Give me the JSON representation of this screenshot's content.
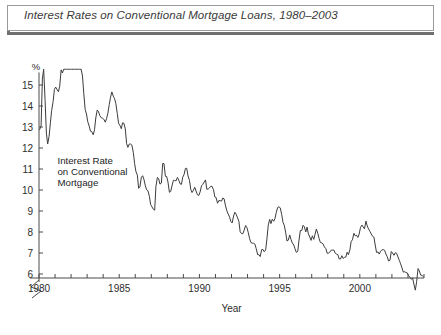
{
  "figure": {
    "title": "Interest Rates on Conventional Mortgage Loans, 1980–2003",
    "annotation_line1": "Interest Rate",
    "annotation_line2": "on Conventional",
    "annotation_line3": "Mortgage",
    "unit_label": "%",
    "xaxis_title": "Year",
    "frame_color": "#9a9a9a",
    "rule_color": "#6f6f6f",
    "line_color": "#3c3c3c",
    "axis_color": "#4a4a4a",
    "background": "#ffffff"
  },
  "chart_data": {
    "type": "line",
    "title": "Interest Rates on Conventional Mortgage Loans, 1980–2003",
    "xlabel": "Year",
    "ylabel": "%",
    "ylim": [
      5.5,
      16.0
    ],
    "xlim": [
      1980,
      2004
    ],
    "grid": false,
    "legend": null,
    "y_ticks": [
      6,
      7,
      8,
      9,
      10,
      11,
      12,
      13,
      14,
      15
    ],
    "y_tick_labels": [
      "6",
      "7",
      "8",
      "9",
      "10",
      "11",
      "12",
      "13",
      "14",
      "15"
    ],
    "y_axis_break": true,
    "x_ticks": [
      1980,
      1981,
      1982,
      1983,
      1984,
      1985,
      1986,
      1987,
      1988,
      1989,
      1990,
      1991,
      1992,
      1993,
      1994,
      1995,
      1996,
      1997,
      1998,
      1999,
      2000,
      2001,
      2002,
      2003,
      2004
    ],
    "x_tick_labels": [
      "1980",
      "",
      "",
      "",
      "",
      "1985",
      "",
      "",
      "",
      "",
      "1990",
      "",
      "",
      "",
      "",
      "1995",
      "",
      "",
      "",
      "",
      "2000",
      "",
      "",
      "",
      ""
    ],
    "annotations": [
      {
        "text": "Interest Rate on Conventional Mortgage",
        "x": 1981.2,
        "y": 11.1
      }
    ],
    "series": [
      {
        "name": "Interest Rate on Conventional Mortgage",
        "x": [
          1980.04,
          1980.13,
          1980.21,
          1980.29,
          1980.38,
          1980.46,
          1980.54,
          1980.63,
          1980.71,
          1980.79,
          1980.88,
          1980.96,
          1981.04,
          1981.13,
          1981.21,
          1981.29,
          1981.38,
          1981.46,
          1981.54,
          1981.63,
          1981.71,
          1981.79,
          1981.88,
          1981.96,
          1982.04,
          1982.13,
          1982.21,
          1982.29,
          1982.38,
          1982.46,
          1982.54,
          1982.63,
          1982.71,
          1982.79,
          1982.88,
          1982.96,
          1983.04,
          1983.13,
          1983.21,
          1983.29,
          1983.38,
          1983.46,
          1983.54,
          1983.63,
          1983.71,
          1983.79,
          1983.88,
          1983.96,
          1984.04,
          1984.13,
          1984.21,
          1984.29,
          1984.38,
          1984.46,
          1984.54,
          1984.63,
          1984.71,
          1984.79,
          1984.88,
          1984.96,
          1985.04,
          1985.13,
          1985.21,
          1985.29,
          1985.38,
          1985.46,
          1985.54,
          1985.63,
          1985.71,
          1985.79,
          1985.88,
          1985.96,
          1986.04,
          1986.13,
          1986.21,
          1986.29,
          1986.38,
          1986.46,
          1986.54,
          1986.63,
          1986.71,
          1986.79,
          1986.88,
          1986.96,
          1987.04,
          1987.13,
          1987.21,
          1987.29,
          1987.38,
          1987.46,
          1987.54,
          1987.63,
          1987.71,
          1987.79,
          1987.88,
          1987.96,
          1988.04,
          1988.13,
          1988.21,
          1988.29,
          1988.38,
          1988.46,
          1988.54,
          1988.63,
          1988.71,
          1988.79,
          1988.88,
          1988.96,
          1989.04,
          1989.13,
          1989.21,
          1989.29,
          1989.38,
          1989.46,
          1989.54,
          1989.63,
          1989.71,
          1989.79,
          1989.88,
          1989.96,
          1990.04,
          1990.13,
          1990.21,
          1990.29,
          1990.38,
          1990.46,
          1990.54,
          1990.63,
          1990.71,
          1990.79,
          1990.88,
          1990.96,
          1991.04,
          1991.13,
          1991.21,
          1991.29,
          1991.38,
          1991.46,
          1991.54,
          1991.63,
          1991.71,
          1991.79,
          1991.88,
          1991.96,
          1992.04,
          1992.13,
          1992.21,
          1992.29,
          1992.38,
          1992.46,
          1992.54,
          1992.63,
          1992.71,
          1992.79,
          1992.88,
          1992.96,
          1993.04,
          1993.13,
          1993.21,
          1993.29,
          1993.38,
          1993.46,
          1993.54,
          1993.63,
          1993.71,
          1993.79,
          1993.88,
          1993.96,
          1994.04,
          1994.13,
          1994.21,
          1994.29,
          1994.38,
          1994.46,
          1994.54,
          1994.63,
          1994.71,
          1994.79,
          1994.88,
          1994.96,
          1995.04,
          1995.13,
          1995.21,
          1995.29,
          1995.38,
          1995.46,
          1995.54,
          1995.63,
          1995.71,
          1995.79,
          1995.88,
          1995.96,
          1996.04,
          1996.13,
          1996.21,
          1996.29,
          1996.38,
          1996.46,
          1996.54,
          1996.63,
          1996.71,
          1996.79,
          1996.88,
          1996.96,
          1997.04,
          1997.13,
          1997.21,
          1997.29,
          1997.38,
          1997.46,
          1997.54,
          1997.63,
          1997.71,
          1997.79,
          1997.88,
          1997.96,
          1998.04,
          1998.13,
          1998.21,
          1998.29,
          1998.38,
          1998.46,
          1998.54,
          1998.63,
          1998.71,
          1998.79,
          1998.88,
          1998.96,
          1999.04,
          1999.13,
          1999.21,
          1999.29,
          1999.38,
          1999.46,
          1999.54,
          1999.63,
          1999.71,
          1999.79,
          1999.88,
          1999.96,
          2000.04,
          2000.13,
          2000.21,
          2000.29,
          2000.38,
          2000.46,
          2000.54,
          2000.63,
          2000.71,
          2000.79,
          2000.88,
          2000.96,
          2001.04,
          2001.13,
          2001.21,
          2001.29,
          2001.38,
          2001.46,
          2001.54,
          2001.63,
          2001.71,
          2001.79,
          2001.88,
          2001.96,
          2002.04,
          2002.13,
          2002.21,
          2002.29,
          2002.38,
          2002.46,
          2002.54,
          2002.63,
          2002.71,
          2002.79,
          2002.88,
          2002.96,
          2003.04,
          2003.13,
          2003.21,
          2003.29,
          2003.38,
          2003.46,
          2003.54,
          2003.63,
          2003.71,
          2003.79,
          2003.88,
          2003.96
        ],
        "values": [
          12.88,
          13.04,
          15.28,
          16.33,
          14.26,
          12.71,
          12.19,
          12.56,
          13.2,
          13.79,
          14.21,
          14.79,
          14.9,
          14.77,
          14.68,
          14.94,
          15.72,
          15.57,
          16.17,
          16.7,
          17.65,
          18.04,
          17.26,
          16.85,
          17.4,
          17.6,
          17.16,
          16.89,
          16.68,
          16.7,
          16.82,
          16.27,
          15.43,
          14.61,
          13.83,
          13.62,
          13.25,
          13.04,
          12.8,
          12.78,
          12.63,
          12.87,
          13.43,
          13.81,
          13.73,
          13.54,
          13.44,
          13.42,
          13.37,
          13.23,
          13.39,
          13.65,
          14.07,
          14.42,
          14.67,
          14.47,
          14.35,
          14.13,
          13.64,
          13.18,
          13.08,
          12.92,
          13.2,
          13.18,
          12.91,
          12.22,
          12.03,
          12.19,
          12.19,
          12.14,
          11.78,
          11.26,
          10.89,
          10.71,
          10.08,
          10.14,
          10.61,
          10.68,
          10.51,
          10.2,
          10.01,
          9.97,
          9.7,
          9.31,
          9.2,
          9.08,
          9.04,
          10.18,
          10.6,
          10.54,
          10.28,
          10.33,
          11.26,
          11.26,
          10.65,
          10.64,
          10.38,
          9.89,
          9.93,
          10.2,
          10.46,
          10.46,
          10.43,
          10.6,
          10.48,
          10.3,
          10.27,
          10.61,
          10.73,
          11.03,
          11.03,
          10.67,
          10.46,
          10.03,
          9.88,
          9.99,
          10.13,
          9.95,
          9.77,
          9.74,
          9.9,
          10.2,
          10.27,
          10.37,
          10.48,
          10.04,
          10.04,
          10.1,
          10.18,
          10.17,
          10.01,
          9.67,
          9.64,
          9.37,
          9.5,
          9.49,
          9.47,
          9.62,
          9.58,
          9.24,
          9.01,
          8.86,
          8.71,
          8.5,
          8.43,
          8.76,
          8.94,
          8.85,
          8.67,
          8.51,
          8.01,
          7.92,
          7.92,
          8.09,
          8.31,
          8.21,
          7.99,
          7.68,
          7.5,
          7.47,
          7.46,
          7.42,
          7.21,
          6.92,
          6.92,
          6.83,
          7.16,
          7.17,
          7.06,
          7.15,
          7.68,
          8.32,
          8.6,
          8.4,
          8.61,
          8.51,
          8.64,
          8.93,
          9.17,
          9.2,
          9.15,
          8.83,
          8.46,
          8.32,
          7.96,
          7.57,
          7.61,
          7.86,
          7.64,
          7.48,
          7.38,
          7.2,
          7.03,
          7.08,
          7.62,
          8.07,
          8.07,
          8.32,
          8.25,
          8.0,
          8.23,
          7.92,
          7.76,
          7.6,
          7.82,
          7.65,
          7.9,
          8.14,
          7.94,
          7.69,
          7.5,
          7.48,
          7.43,
          7.29,
          7.21,
          6.99,
          6.99,
          7.04,
          7.13,
          7.14,
          7.14,
          7.0,
          6.95,
          6.92,
          6.72,
          6.71,
          6.87,
          6.74,
          6.79,
          6.81,
          7.04,
          6.92,
          7.15,
          7.55,
          7.63,
          7.94,
          7.82,
          7.85,
          7.74,
          7.91,
          8.21,
          8.33,
          8.24,
          8.15,
          8.52,
          8.29,
          8.15,
          8.03,
          7.91,
          7.8,
          7.75,
          7.38,
          7.03,
          7.05,
          6.95,
          7.08,
          7.15,
          7.16,
          7.13,
          6.95,
          6.82,
          6.62,
          6.66,
          7.07,
          7.0,
          6.89,
          7.01,
          6.99,
          6.81,
          6.65,
          6.49,
          6.29,
          6.09,
          6.11,
          6.07,
          6.05,
          5.92,
          5.84,
          5.75,
          5.81,
          5.48,
          5.23,
          5.63,
          6.26,
          6.15,
          5.95,
          5.93,
          5.88
        ]
      }
    ]
  }
}
